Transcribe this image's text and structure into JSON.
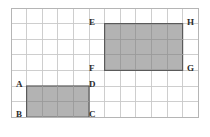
{
  "figure": {
    "background_color": "#ffffff",
    "grid": {
      "columns": 12,
      "rows": 7,
      "cell_size_px": 15.6,
      "origin_x_px": 11,
      "origin_y_px": 8,
      "line_color": "#c9c9c9",
      "border_color": "#b5b5b5"
    },
    "shapes": [
      {
        "id": "rectangle-abcd",
        "name": "lower-left-rectangle",
        "vertices_order": [
          "A",
          "B",
          "C",
          "D"
        ],
        "grid_col_start": 1,
        "grid_col_end": 5,
        "grid_row_start": 5,
        "grid_row_end": 7,
        "width_cells": 4,
        "height_cells": 2,
        "area_cells": 8,
        "fill_color": "#b3b3b3",
        "stroke_color": "#5a5a5a"
      },
      {
        "id": "rectangle-efgh",
        "name": "upper-right-rectangle",
        "vertices_order": [
          "E",
          "H",
          "G",
          "F"
        ],
        "grid_col_start": 6,
        "grid_col_end": 11,
        "grid_row_start": 1,
        "grid_row_end": 4,
        "width_cells": 5,
        "height_cells": 3,
        "area_cells": 15,
        "fill_color": "#b3b3b3",
        "stroke_color": "#5a5a5a"
      }
    ],
    "labels": [
      {
        "id": "label-a",
        "text": "A",
        "x": 16,
        "y": 80,
        "anchor": "top-left-of-lower-rectangle"
      },
      {
        "id": "label-b",
        "text": "B",
        "x": 16,
        "y": 110,
        "anchor": "bottom-left-of-lower-rectangle"
      },
      {
        "id": "label-c",
        "text": "C",
        "x": 89,
        "y": 110,
        "anchor": "bottom-right-of-lower-rectangle"
      },
      {
        "id": "label-d",
        "text": "D",
        "x": 89,
        "y": 80,
        "anchor": "top-right-of-lower-rectangle"
      },
      {
        "id": "label-e",
        "text": "E",
        "x": 89,
        "y": 18,
        "anchor": "top-left-of-upper-rectangle"
      },
      {
        "id": "label-f",
        "text": "F",
        "x": 89,
        "y": 64,
        "anchor": "bottom-left-of-upper-rectangle"
      },
      {
        "id": "label-g",
        "text": "G",
        "x": 187,
        "y": 64,
        "anchor": "bottom-right-of-upper-rectangle"
      },
      {
        "id": "label-h",
        "text": "H",
        "x": 187,
        "y": 18,
        "anchor": "top-right-of-upper-rectangle"
      }
    ]
  }
}
